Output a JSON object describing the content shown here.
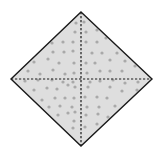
{
  "figure": {
    "shape": "diamond",
    "fill_color": "#dedede",
    "dot_color": "#a9a9a9",
    "outline_color": "#1a1a1a",
    "divider_color": "#1a1a1a",
    "divider_style": "dashed",
    "dividers": [
      "horizontal",
      "vertical"
    ],
    "regions": [
      "top-left",
      "top-right",
      "bottom-left",
      "bottom-right"
    ]
  }
}
